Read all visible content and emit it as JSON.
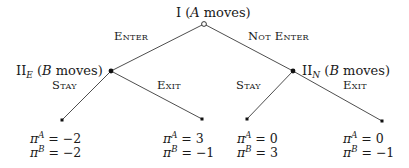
{
  "diagram": {
    "type": "extensive-form game tree",
    "root": {
      "label_prefix": "I",
      "label_paren": "(",
      "label_player": "A",
      "label_suffix": " moves)",
      "x": 204,
      "y": 24,
      "marker": "hollow-circle"
    },
    "decision_nodes": [
      {
        "id": "II_E",
        "label_main": "II",
        "label_sub": "E",
        "label_paren": " (",
        "label_player": "B",
        "label_suffix": " moves)",
        "x": 111,
        "y": 71,
        "marker": "filled-circle"
      },
      {
        "id": "II_N",
        "label_main": "II",
        "label_sub": "N",
        "label_paren": " (",
        "label_player": "B",
        "label_suffix": " moves)",
        "x": 293,
        "y": 71,
        "marker": "filled-circle"
      }
    ],
    "edges": [
      {
        "from": "root",
        "to": "II_E",
        "label": "Enter",
        "label_x": 110,
        "label_y": 39
      },
      {
        "from": "root",
        "to": "II_N",
        "label": "Not Enter",
        "label_x": 252,
        "label_y": 40
      },
      {
        "from": "II_E",
        "to": "t1",
        "label": "Stay",
        "label_x": 48,
        "label_y": 89
      },
      {
        "from": "II_E",
        "to": "t2",
        "label": "Exit",
        "label_x": 154,
        "label_y": 89
      },
      {
        "from": "II_N",
        "to": "t3",
        "label": "Stay",
        "label_x": 233,
        "label_y": 89
      },
      {
        "from": "II_N",
        "to": "t4",
        "label": "Exit",
        "label_x": 341,
        "label_y": 89
      }
    ],
    "terminals": [
      {
        "id": "t1",
        "x": 62,
        "y": 120,
        "payoff_A": "−2",
        "payoff_B": "−2"
      },
      {
        "id": "t2",
        "x": 202,
        "y": 119,
        "payoff_A": "3",
        "payoff_B": "−1"
      },
      {
        "id": "t3",
        "x": 247,
        "y": 119,
        "payoff_A": "0",
        "payoff_B": "3"
      },
      {
        "id": "t4",
        "x": 382,
        "y": 121,
        "payoff_A": "0",
        "payoff_B": "−1"
      }
    ],
    "payoff_symbol": "π",
    "player_A": "A",
    "player_B": "B",
    "equals": " = "
  }
}
